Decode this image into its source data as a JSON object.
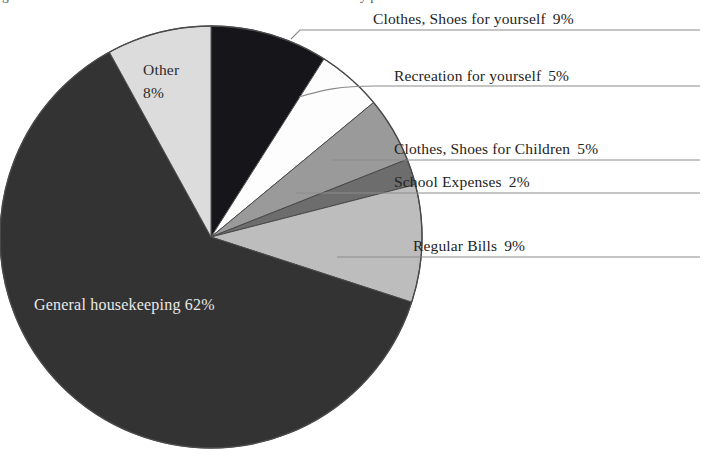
{
  "clipped_top_text": {
    "left_fragment": "g",
    "right_fragment": "y  p"
  },
  "chart_data": {
    "type": "pie",
    "title": "",
    "subtitle": "",
    "xlabel": "",
    "ylabel": "",
    "legend_position": "callout-labels-right",
    "grid": false,
    "units": "percent",
    "start_angle_deg": 0,
    "direction": "clockwise",
    "categories": [
      "Clothes, Shoes for yourself",
      "Recreation for yourself",
      "Clothes, Shoes for Children",
      "School Expenses",
      "Regular Bills",
      "General housekeeping",
      "Other"
    ],
    "values": [
      9,
      5,
      5,
      2,
      9,
      62,
      8
    ],
    "slices": [
      {
        "label": "Clothes, Shoes for yourself",
        "value": 9,
        "value_text": "9%",
        "color": "#16161a",
        "label_placement": "callout",
        "callout_text": "Clothes, Shoes for yourself",
        "callout_pct": "9%"
      },
      {
        "label": "Recreation for yourself",
        "value": 5,
        "value_text": "5%",
        "color": "#fdfdfd",
        "label_placement": "callout",
        "callout_text": "Recreation for yourself",
        "callout_pct": "5%"
      },
      {
        "label": "Clothes, Shoes for Children",
        "value": 5,
        "value_text": "5%",
        "color": "#9a9a9a",
        "label_placement": "callout",
        "callout_text": "Clothes, Shoes for Children",
        "callout_pct": "5%"
      },
      {
        "label": "School Expenses",
        "value": 2,
        "value_text": "2%",
        "color": "#6d6d6d",
        "label_placement": "callout",
        "callout_text": "School Expenses",
        "callout_pct": "2%"
      },
      {
        "label": "Regular Bills",
        "value": 9,
        "value_text": "9%",
        "color": "#bdbdbd",
        "label_placement": "callout",
        "callout_text": "Regular Bills",
        "callout_pct": "9%"
      },
      {
        "label": "General housekeeping",
        "value": 62,
        "value_text": "62%",
        "color": "#333333",
        "label_placement": "inside",
        "inside_label": "General housekeeping  62%",
        "inside_text_color": "#e9e9e9"
      },
      {
        "label": "Other",
        "value": 8,
        "value_text": "8%",
        "color": "#dcdcdc",
        "label_placement": "inside",
        "inside_label_line1": "Other",
        "inside_label_line2": "8%",
        "inside_text_color": "#2b2b2b"
      }
    ]
  },
  "callouts": [
    {
      "text": "Clothes, Shoes for yourself",
      "pct": "9%"
    },
    {
      "text": "Recreation for yourself",
      "pct": "5%"
    },
    {
      "text": "Clothes, Shoes for Children",
      "pct": "5%"
    },
    {
      "text": "School Expenses",
      "pct": "2%"
    },
    {
      "text": "Regular Bills",
      "pct": "9%"
    }
  ],
  "colors": {
    "background": "#ffffff",
    "pie_outline": "#4a4a4a",
    "leader_line": "#8c8c8c",
    "text": "#232323",
    "inverse_text": "#e9e9e9"
  }
}
